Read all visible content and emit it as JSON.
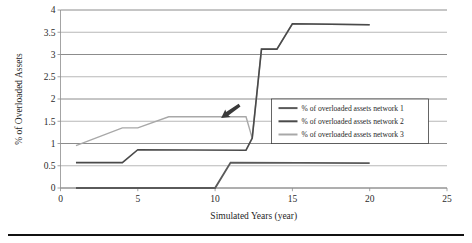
{
  "chart_data": {
    "type": "line",
    "title": "",
    "xlabel": "Simulated Years (year)",
    "ylabel": "% of Overloaded Assets",
    "xlim": [
      0,
      25
    ],
    "ylim": [
      0,
      4
    ],
    "xticks": [
      "0",
      "5",
      "10",
      "15",
      "20",
      "25"
    ],
    "xtick_values": [
      0,
      5,
      10,
      15,
      20,
      25
    ],
    "yticks": [
      "0",
      "0.5",
      "1",
      "1.5",
      "2",
      "2.5",
      "3",
      "3.5",
      "4"
    ],
    "ytick_values": [
      0,
      0.5,
      1,
      1.5,
      2,
      2.5,
      3,
      3.5,
      4
    ],
    "grid": true,
    "grid_axis": "y",
    "legend_position": "center-right",
    "series": [
      {
        "name": "% of overloaded assets network 1",
        "color": "#5a5a5a",
        "width": 1.9,
        "x": [
          1,
          10,
          11,
          20
        ],
        "values": [
          0,
          0,
          0.57,
          0.56
        ]
      },
      {
        "name": "% of overloaded assets network 2",
        "color": "#4a4a4a",
        "width": 1.6,
        "x": [
          1,
          4,
          5,
          12,
          12.4,
          13,
          14,
          15,
          20
        ],
        "values": [
          0.57,
          0.57,
          0.86,
          0.85,
          1.12,
          3.12,
          3.12,
          3.69,
          3.67
        ]
      },
      {
        "name": "% of overloaded assets network 3",
        "color": "#a8a8a8",
        "width": 1.4,
        "x": [
          1,
          4,
          5,
          7,
          12,
          12.4,
          13,
          14,
          15,
          20
        ],
        "values": [
          0.95,
          1.35,
          1.35,
          1.6,
          1.6,
          1.12,
          3.12,
          3.12,
          3.69,
          3.67
        ]
      }
    ],
    "annotations": [
      {
        "name": "arrow-pointer",
        "x": 11.0,
        "y": 1.72,
        "angle": 55
      }
    ]
  },
  "legend": {
    "items": [
      {
        "label": "% of overloaded assets network 1",
        "color": "#5a5a5a"
      },
      {
        "label": "% of overloaded assets network 2",
        "color": "#4a4a4a"
      },
      {
        "label": "% of overloaded assets network 3",
        "color": "#a8a8a8"
      }
    ]
  }
}
